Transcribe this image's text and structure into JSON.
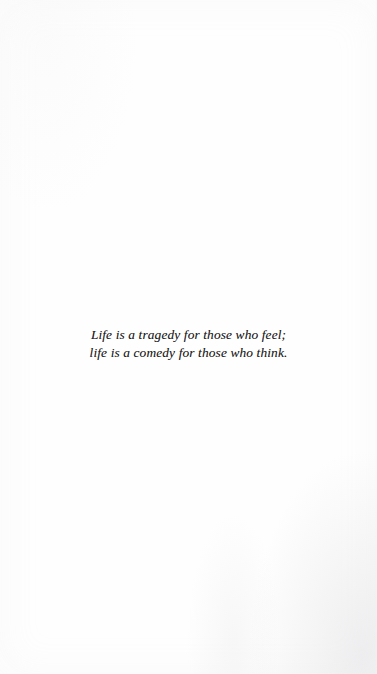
{
  "page": {
    "kind": "scanned-book-epigraph-page",
    "background_color": "#fefefe",
    "ink_color": "#1b1a19",
    "width": 377,
    "height": 674
  },
  "epigraph": {
    "alignment": "center",
    "style": "italic-serif",
    "lines": [
      "Life is a tragedy for those who feel;",
      "life is a comedy for those who think."
    ],
    "full_text": "Life is a tragedy for those who feel; life is a comedy for those who think."
  }
}
